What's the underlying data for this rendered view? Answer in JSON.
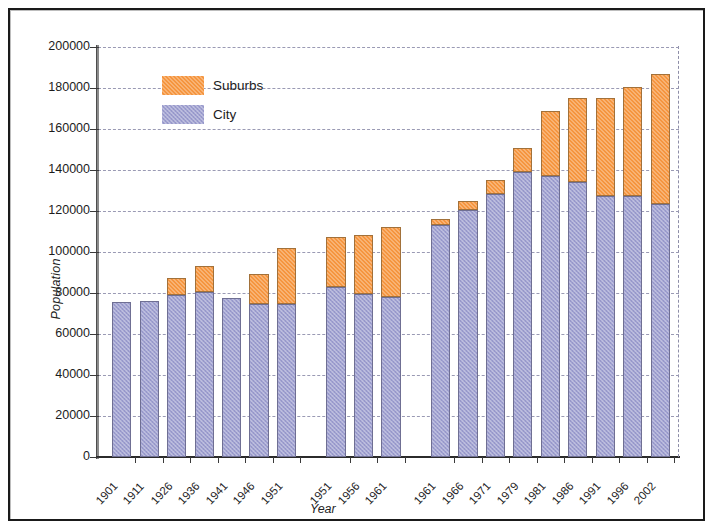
{
  "chart_data": {
    "type": "bar",
    "subtype": "stacked",
    "title": "",
    "xlabel": "Year",
    "ylabel": "Population",
    "ylim": [
      0,
      200000
    ],
    "ytick_step": 20000,
    "yticks": [
      200000,
      180000,
      160000,
      140000,
      120000,
      100000,
      80000,
      60000,
      40000,
      20000,
      0
    ],
    "ytick_labels": [
      "200000",
      "180000",
      "160000",
      "140000",
      "120000",
      "100000",
      "80000",
      "60000",
      "40000",
      "20000",
      "0"
    ],
    "grid": true,
    "grid_style": "dashed-horizontal",
    "legend": {
      "position": "upper-left-inside",
      "entries": [
        {
          "name": "Suburbs",
          "color": "#f5953f"
        },
        {
          "name": "City",
          "color": "#9fa0d0"
        }
      ]
    },
    "categories": [
      "1901",
      "1911",
      "1926",
      "1936",
      "1941",
      "1946",
      "1951",
      "1951",
      "1956",
      "1961",
      "1961",
      "1966",
      "1971",
      "1979",
      "1981",
      "1986",
      "1991",
      "1996",
      "2002"
    ],
    "groups": [
      {
        "name": "group-1",
        "categories": [
          "1901",
          "1911",
          "1926",
          "1936",
          "1941",
          "1946",
          "1951"
        ]
      },
      {
        "name": "group-2",
        "categories": [
          "1951",
          "1956",
          "1961"
        ]
      },
      {
        "name": "group-3",
        "categories": [
          "1961",
          "1966",
          "1971",
          "1979",
          "1981",
          "1986",
          "1991",
          "1996",
          "2002"
        ]
      }
    ],
    "series": [
      {
        "name": "City",
        "color": "#9fa0d0",
        "values": [
          75500,
          76000,
          79000,
          80500,
          77500,
          74500,
          74500,
          83000,
          79500,
          78000,
          113000,
          120500,
          128500,
          139000,
          137000,
          134000,
          127500,
          127500,
          123500
        ]
      },
      {
        "name": "Suburbs",
        "color": "#f5953f",
        "values": [
          0,
          0,
          8500,
          12500,
          0,
          15000,
          27500,
          24500,
          29000,
          34000,
          3000,
          4500,
          6500,
          11500,
          32000,
          41000,
          47500,
          53000,
          63500
        ]
      }
    ],
    "totals": [
      75500,
      76000,
      87500,
      93000,
      77500,
      89500,
      102000,
      107500,
      108500,
      112000,
      116000,
      125000,
      135000,
      150500,
      169000,
      175000,
      175000,
      180500,
      187000
    ]
  }
}
